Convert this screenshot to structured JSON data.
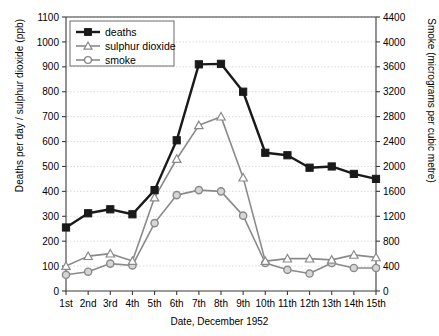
{
  "chart_data": {
    "type": "line",
    "title": "",
    "xlabel": "Date, December 1952",
    "ylabel": "Deaths per day / sulphur dioxide (ppb)",
    "ylabel_right": "Smoke (micrograms per cubic metre)",
    "categories": [
      "1st",
      "2nd",
      "3rd",
      "4th",
      "5th",
      "6th",
      "7th",
      "8th",
      "9th",
      "10th",
      "11th",
      "12th",
      "13th",
      "14th",
      "15th"
    ],
    "ylim": [
      0,
      1100
    ],
    "yticks": [
      0,
      100,
      200,
      300,
      400,
      500,
      600,
      700,
      800,
      900,
      1000,
      1100
    ],
    "ylim_right": [
      0,
      4400
    ],
    "yticks_right": [
      0,
      400,
      800,
      1200,
      1600,
      2000,
      2400,
      2800,
      3200,
      3600,
      4000,
      4400
    ],
    "grid": true,
    "legend_position": "top-left",
    "series": [
      {
        "name": "deaths",
        "axis": "left",
        "marker": "filled-square",
        "color": "#1a1a1a",
        "values": [
          255,
          312,
          328,
          308,
          405,
          605,
          910,
          912,
          800,
          555,
          545,
          495,
          500,
          470,
          450
        ]
      },
      {
        "name": "sulphur dioxide",
        "axis": "left",
        "marker": "open-triangle",
        "color": "#8a8a8a",
        "values": [
          100,
          140,
          150,
          120,
          375,
          530,
          665,
          700,
          455,
          120,
          130,
          130,
          125,
          145,
          135
        ]
      },
      {
        "name": "smoke",
        "axis": "right",
        "marker": "open-circle",
        "color": "#8a8a8a",
        "values": [
          260,
          310,
          440,
          410,
          1090,
          1540,
          1620,
          1600,
          1210,
          450,
          340,
          280,
          450,
          370,
          370
        ]
      }
    ]
  }
}
